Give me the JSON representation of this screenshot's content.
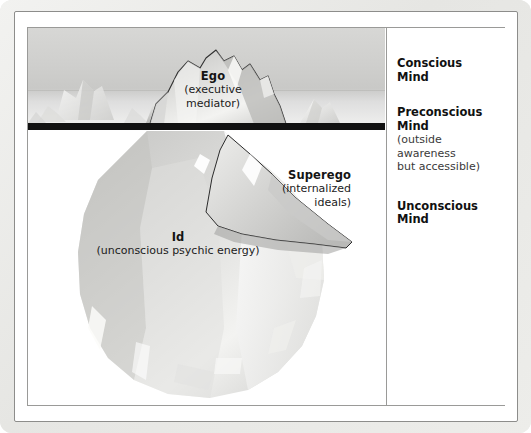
{
  "diagram": {
    "colors": {
      "frame": "#e9e9e7",
      "waterline": "#111111",
      "sea": "#3f434a",
      "sky": "#cfcfcd",
      "ice_light": "#f2f2f0",
      "ice_shadow": "#b6b6b4",
      "text": "#141414"
    },
    "iceberg_labels": [
      {
        "id": "ego",
        "heading": "Ego",
        "subtext": "(executive\nmediator)",
        "align": "center"
      },
      {
        "id": "superego",
        "heading": "Superego",
        "subtext": "(internalized\nideals)",
        "align": "right"
      },
      {
        "id": "id",
        "heading": "Id",
        "subtext": "(unconscious psychic energy)",
        "align": "center"
      }
    ],
    "ego": {
      "heading": "Ego",
      "line1": "(executive",
      "line2": "mediator)"
    },
    "superego": {
      "heading": "Superego",
      "line1": "(internalized",
      "line2": "ideals)"
    },
    "id": {
      "heading": "Id",
      "line1": "(unconscious psychic energy)"
    }
  },
  "panel": {
    "conscious": {
      "title_line1": "Conscious",
      "title_line2": "Mind"
    },
    "preconscious": {
      "title_line1": "Preconscious",
      "title_line2": "Mind",
      "note_line1": "(outside",
      "note_line2": "awareness",
      "note_line3": "but accessible)"
    },
    "unconscious": {
      "title_line1": "Unconscious",
      "title_line2": "Mind"
    }
  }
}
